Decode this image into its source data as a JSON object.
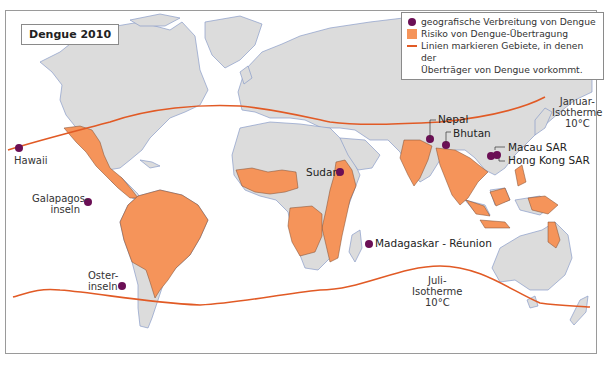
{
  "title": "Dengue 2010",
  "colors": {
    "land": "#dcdcdc",
    "border": "#6f6f6f",
    "coast": "#8a9cc8",
    "risk": "#f5945a",
    "dot": "#6b0f55",
    "isotherm": "#e15a25",
    "water": "#ffffff"
  },
  "legend": {
    "items": [
      {
        "symbol": "dot",
        "label": "geografische Verbreitung von Dengue"
      },
      {
        "symbol": "square",
        "label": "Risiko von Dengue-Übertragung"
      },
      {
        "symbol": "line",
        "label": "Linien markieren Gebiete, in denen der",
        "label2": "Überträger von Dengue vorkommt."
      }
    ]
  },
  "isotherms": {
    "north": {
      "line1": "Januar-",
      "line2": "Isotherme",
      "line3": "10°C"
    },
    "south": {
      "line1": "Juli-",
      "line2": "Isotherme",
      "line3": "10°C"
    }
  },
  "places": {
    "hawaii": "Hawaii",
    "galapagos": {
      "line1": "Galapagos-",
      "line2": "inseln"
    },
    "easter": {
      "line1": "Oster-",
      "line2": "inseln"
    },
    "sudan": "Sudan",
    "madagascar": "Madagaskar - Réunion",
    "nepal": "Nepal",
    "bhutan": "Bhutan",
    "macau": "Macau SAR",
    "hongkong": "Hong Kong SAR"
  }
}
